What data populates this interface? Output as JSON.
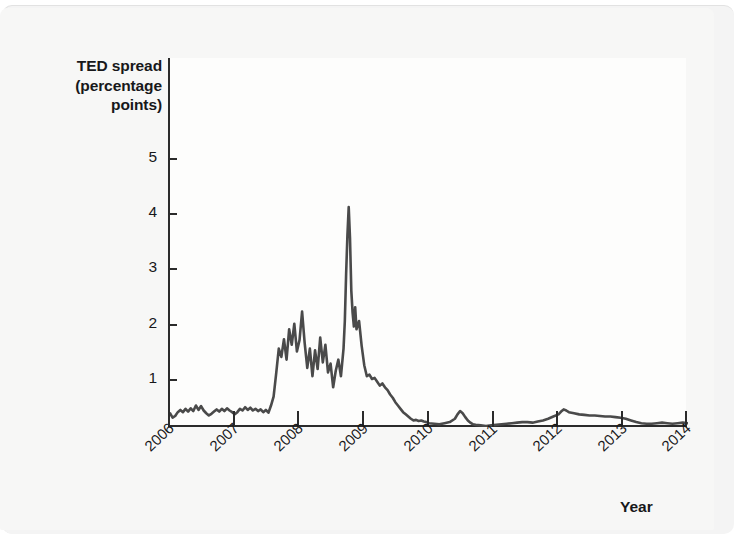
{
  "figure": {
    "background_color": "#f7f7f6",
    "plot_background_color": "#fdfdfc",
    "axis_color": "#2b2b2b",
    "line_color": "#4a4a4a"
  },
  "ylabel_lines": [
    "TED spread",
    "(percentage",
    "points)"
  ],
  "xaxis_name": "Year",
  "chart_data": {
    "type": "line",
    "title": "",
    "subtitle": "",
    "xlabel": "Year",
    "ylabel": "TED spread (percentage points)",
    "xlim": [
      2006.0,
      2014.0
    ],
    "ylim": [
      0,
      5.6
    ],
    "yticks": [
      1,
      2,
      3,
      4,
      5
    ],
    "ytick_labels": [
      "1",
      "2",
      "3",
      "4",
      "5"
    ],
    "xticks": [
      2006,
      2007,
      2008,
      2009,
      2010,
      2011,
      2012,
      2013,
      2014
    ],
    "xtick_labels": [
      "2006",
      "2007",
      "2008",
      "2009",
      "2010",
      "2011",
      "2012",
      "2013",
      "2014"
    ],
    "grid": false,
    "legend": false,
    "legend_position": "none",
    "annotations": [],
    "series": [
      {
        "name": "TED spread",
        "color": "#4a4a4a",
        "linewidth": 2.6,
        "x": [
          2006.0,
          2006.04,
          2006.08,
          2006.12,
          2006.16,
          2006.2,
          2006.24,
          2006.28,
          2006.32,
          2006.36,
          2006.4,
          2006.44,
          2006.48,
          2006.52,
          2006.56,
          2006.6,
          2006.64,
          2006.68,
          2006.72,
          2006.76,
          2006.8,
          2006.84,
          2006.88,
          2006.92,
          2006.96,
          2007.0,
          2007.04,
          2007.08,
          2007.12,
          2007.16,
          2007.2,
          2007.24,
          2007.28,
          2007.32,
          2007.36,
          2007.4,
          2007.44,
          2007.48,
          2007.52,
          2007.56,
          2007.6,
          2007.64,
          2007.68,
          2007.72,
          2007.76,
          2007.8,
          2007.84,
          2007.88,
          2007.92,
          2007.96,
          2008.0,
          2008.04,
          2008.08,
          2008.12,
          2008.16,
          2008.2,
          2008.24,
          2008.28,
          2008.32,
          2008.36,
          2008.4,
          2008.44,
          2008.48,
          2008.52,
          2008.56,
          2008.6,
          2008.64,
          2008.68,
          2008.7,
          2008.72,
          2008.74,
          2008.76,
          2008.78,
          2008.8,
          2008.82,
          2008.84,
          2008.86,
          2008.88,
          2008.92,
          2008.96,
          2009.0,
          2009.04,
          2009.08,
          2009.12,
          2009.16,
          2009.2,
          2009.24,
          2009.28,
          2009.32,
          2009.36,
          2009.4,
          2009.44,
          2009.48,
          2009.52,
          2009.56,
          2009.6,
          2009.64,
          2009.68,
          2009.72,
          2009.76,
          2009.8,
          2009.84,
          2009.88,
          2009.92,
          2009.96,
          2010.0,
          2010.08,
          2010.16,
          2010.24,
          2010.32,
          2010.4,
          2010.44,
          2010.48,
          2010.52,
          2010.56,
          2010.6,
          2010.64,
          2010.68,
          2010.72,
          2010.8,
          2010.88,
          2010.96,
          2011.04,
          2011.12,
          2011.2,
          2011.28,
          2011.36,
          2011.44,
          2011.52,
          2011.6,
          2011.68,
          2011.76,
          2011.84,
          2011.92,
          2012.0,
          2012.04,
          2012.08,
          2012.12,
          2012.16,
          2012.24,
          2012.32,
          2012.4,
          2012.48,
          2012.56,
          2012.64,
          2012.72,
          2012.8,
          2012.88,
          2012.96,
          2013.04,
          2013.12,
          2013.2,
          2013.28,
          2013.36,
          2013.44,
          2013.52,
          2013.6,
          2013.68,
          2013.76,
          2013.84,
          2013.92,
          2014.0
        ],
        "y": [
          0.38,
          0.3,
          0.33,
          0.4,
          0.44,
          0.4,
          0.46,
          0.41,
          0.47,
          0.42,
          0.52,
          0.44,
          0.51,
          0.43,
          0.38,
          0.34,
          0.37,
          0.41,
          0.45,
          0.41,
          0.46,
          0.42,
          0.47,
          0.43,
          0.4,
          0.36,
          0.4,
          0.46,
          0.43,
          0.49,
          0.44,
          0.48,
          0.43,
          0.46,
          0.42,
          0.45,
          0.4,
          0.44,
          0.39,
          0.52,
          0.68,
          1.1,
          1.55,
          1.4,
          1.72,
          1.35,
          1.9,
          1.62,
          2.0,
          1.5,
          1.7,
          2.22,
          1.65,
          1.2,
          1.55,
          1.05,
          1.52,
          1.18,
          1.75,
          1.3,
          1.62,
          1.12,
          1.28,
          0.85,
          1.15,
          1.35,
          1.05,
          1.55,
          2.05,
          2.9,
          3.6,
          4.11,
          3.55,
          2.6,
          2.2,
          1.95,
          2.3,
          1.9,
          2.05,
          1.6,
          1.25,
          1.05,
          1.08,
          1.0,
          1.02,
          0.95,
          0.88,
          0.92,
          0.85,
          0.8,
          0.72,
          0.66,
          0.58,
          0.52,
          0.46,
          0.4,
          0.36,
          0.32,
          0.28,
          0.25,
          0.26,
          0.24,
          0.25,
          0.23,
          0.22,
          0.2,
          0.19,
          0.18,
          0.2,
          0.22,
          0.28,
          0.36,
          0.42,
          0.38,
          0.31,
          0.25,
          0.21,
          0.18,
          0.17,
          0.16,
          0.15,
          0.16,
          0.17,
          0.18,
          0.19,
          0.2,
          0.21,
          0.22,
          0.22,
          0.21,
          0.23,
          0.25,
          0.28,
          0.32,
          0.36,
          0.41,
          0.45,
          0.43,
          0.4,
          0.38,
          0.36,
          0.35,
          0.34,
          0.34,
          0.33,
          0.32,
          0.32,
          0.31,
          0.3,
          0.28,
          0.25,
          0.22,
          0.2,
          0.19,
          0.19,
          0.2,
          0.21,
          0.2,
          0.19,
          0.2,
          0.21,
          0.2
        ]
      }
    ]
  }
}
